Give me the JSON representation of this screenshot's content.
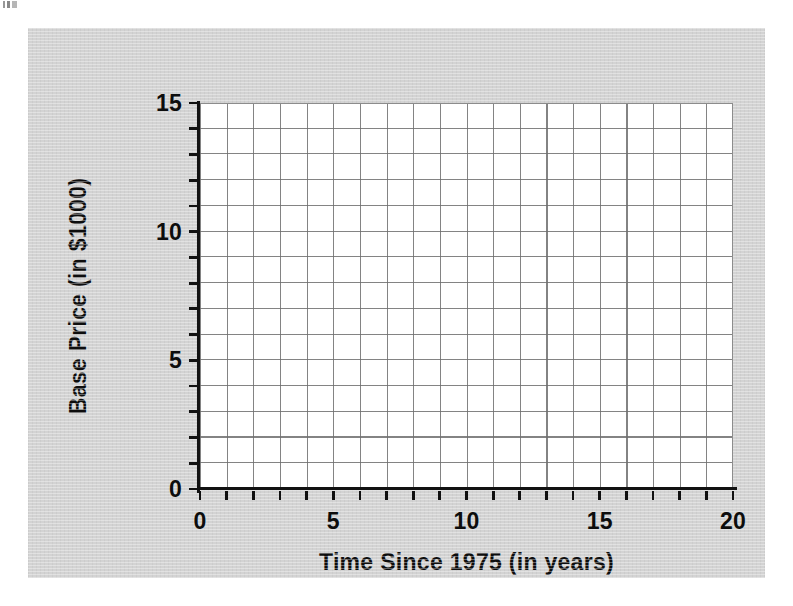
{
  "figure": {
    "background_color": "#d3d3d3",
    "page_background_color": "#ffffff",
    "plot_background_color": "#ffffff",
    "grid_line_color": "#6e6e6e",
    "axis_color": "#111111",
    "text_color": "#0d0d0d"
  },
  "artifact": {
    "name": "scan-speck"
  },
  "chart_data": {
    "type": "line",
    "title": "",
    "subtitle": "",
    "xlabel": "Time Since 1975 (in years)",
    "ylabel": "Base Price (in $1000)",
    "xlim": [
      0,
      20
    ],
    "ylim": [
      0,
      15
    ],
    "x_tick_labels": [
      "0",
      "5",
      "10",
      "15",
      "20"
    ],
    "x_tick_values": [
      0,
      5,
      10,
      15,
      20
    ],
    "x_minor_tick_values": [
      0,
      1,
      2,
      3,
      4,
      5,
      6,
      7,
      8,
      9,
      10,
      11,
      12,
      13,
      14,
      15,
      16,
      17,
      18,
      19,
      20
    ],
    "y_tick_labels": [
      "0",
      "5",
      "10",
      "15"
    ],
    "y_tick_values": [
      0,
      5,
      10,
      15
    ],
    "y_minor_tick_values": [
      0,
      1,
      2,
      3,
      4,
      5,
      6,
      7,
      8,
      9,
      10,
      11,
      12,
      13,
      14,
      15
    ],
    "grid": true,
    "grid_columns": 20,
    "grid_rows": 15,
    "legend": null,
    "legend_position": "none",
    "annotations": [],
    "series": [],
    "x": [],
    "values": [],
    "note": "Blank coordinate grid — no data series are plotted."
  }
}
